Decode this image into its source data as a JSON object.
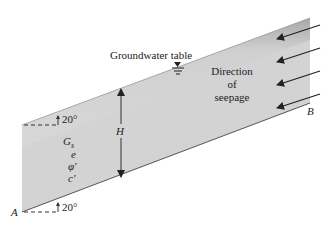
{
  "diagram": {
    "labels": {
      "groundwater_table": "Groundwater table",
      "direction_line1": "Direction",
      "direction_line2": "of",
      "direction_line3": "seepage",
      "point_a": "A",
      "point_b": "B",
      "height": "H",
      "angle_top": "20°",
      "angle_bottom": "20°"
    },
    "soil_parameters": [
      "G",
      "e",
      "φ′",
      "c′"
    ],
    "soil_parameter_subscript": "s",
    "slope_angle_deg": 20,
    "seepage_arrow_count": 4,
    "colors": {
      "soil_fill": "#d4d4d4",
      "soil_dark": "#a8a8a8",
      "line": "#333333"
    }
  }
}
